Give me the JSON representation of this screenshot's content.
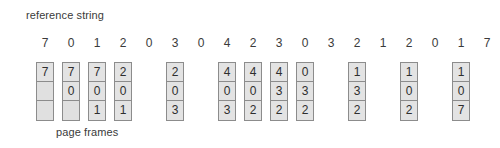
{
  "labels": {
    "reference_string": "reference string",
    "page_frames": "page frames"
  },
  "chart_data": {
    "type": "table",
    "title": "reference string",
    "xlabel": "page frames",
    "ylabel": "",
    "grid": false,
    "legend": null,
    "reference_string": [
      7,
      0,
      1,
      2,
      0,
      3,
      0,
      4,
      2,
      3,
      0,
      3,
      2,
      1,
      2,
      0,
      1,
      7,
      0,
      1
    ],
    "frame_count": 3,
    "columns": [
      {
        "ref_index": 0,
        "ref_value": 7,
        "cells": [
          "7",
          "",
          ""
        ]
      },
      {
        "ref_index": 1,
        "ref_value": 0,
        "cells": [
          "7",
          "0",
          ""
        ]
      },
      {
        "ref_index": 2,
        "ref_value": 1,
        "cells": [
          "7",
          "0",
          "1"
        ]
      },
      {
        "ref_index": 3,
        "ref_value": 2,
        "cells": [
          "2",
          "0",
          "1"
        ]
      },
      {
        "ref_index": 5,
        "ref_value": 3,
        "cells": [
          "2",
          "0",
          "3"
        ]
      },
      {
        "ref_index": 7,
        "ref_value": 4,
        "cells": [
          "4",
          "0",
          "3"
        ]
      },
      {
        "ref_index": 8,
        "ref_value": 2,
        "cells": [
          "4",
          "0",
          "2"
        ]
      },
      {
        "ref_index": 9,
        "ref_value": 3,
        "cells": [
          "4",
          "3",
          "2"
        ]
      },
      {
        "ref_index": 10,
        "ref_value": 0,
        "cells": [
          "0",
          "3",
          "2"
        ]
      },
      {
        "ref_index": 12,
        "ref_value": 2,
        "cells": [
          "1",
          "3",
          "2"
        ]
      },
      {
        "ref_index": 14,
        "ref_value": 2,
        "cells": [
          "1",
          "0",
          "2"
        ]
      },
      {
        "ref_index": 16,
        "ref_value": 1,
        "cells": [
          "1",
          "0",
          "7"
        ]
      }
    ]
  },
  "geometry": {
    "ref_origin_x": 36,
    "ref_step_x": 26,
    "col_width": 18,
    "cell_height": 19
  }
}
